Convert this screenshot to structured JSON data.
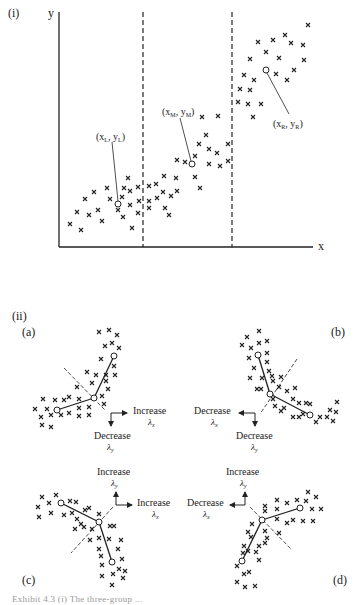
{
  "part_i": {
    "label": "(i)",
    "y_axis_label": "y",
    "x_axis_label": "x",
    "points": {
      "left": "(xₗ, yₗ)",
      "left_main": "(x",
      "left_sub": "L",
      "left_y": ", y",
      "left_ysub": "L",
      "mid_main": "(x",
      "mid_sub": "M",
      "mid_y": ", y",
      "mid_ysub": "M",
      "right_main": "(x",
      "right_sub": "R",
      "right_y": ", y",
      "right_ysub": "R",
      "close": ")"
    }
  },
  "part_ii": {
    "label": "(ii)",
    "panels": {
      "a": {
        "label": "(a)",
        "h_dir": "Increase",
        "h_sym": "λ",
        "h_sub": "x",
        "v_dir": "Decrease",
        "v_sym": "λ",
        "v_sub": "y"
      },
      "b": {
        "label": "(b)",
        "h_dir": "Decrease",
        "h_sym": "λ",
        "h_sub": "x",
        "v_dir": "Decrease",
        "v_sym": "λ",
        "v_sub": "y"
      },
      "c": {
        "label": "(c)",
        "h_dir": "Increase",
        "h_sym": "λ",
        "h_sub": "x",
        "v_dir": "Increase",
        "v_sym": "λ",
        "v_sub": "y"
      },
      "d": {
        "label": "(d)",
        "h_dir": "Decrease",
        "h_sym": "λ",
        "h_sub": "x",
        "v_dir": "Increase",
        "v_sym": "λ",
        "v_sub": "y"
      }
    }
  },
  "caption": "Exhibit 4.3  (i) The three-group ..."
}
